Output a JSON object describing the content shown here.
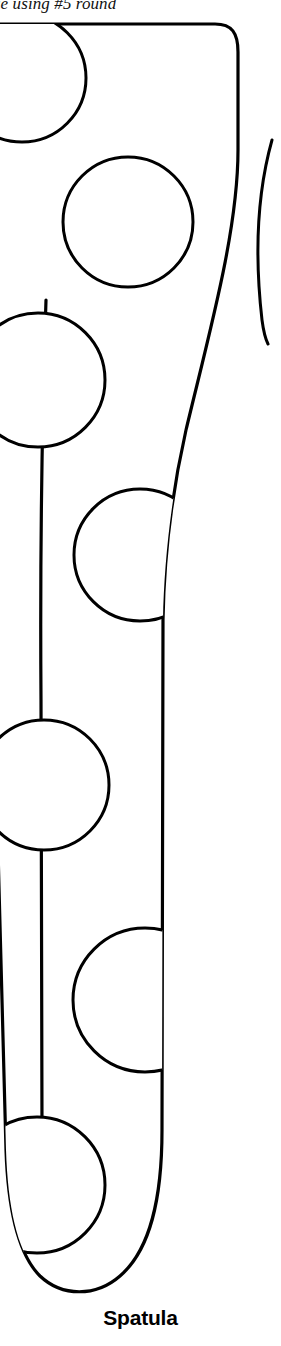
{
  "page": {
    "width": 281,
    "height": 1346,
    "background_color": "#ffffff",
    "ink_color": "#000000",
    "media_type": "line-art-illustration"
  },
  "top_caption": {
    "text": "ue using #5 round",
    "note": "clipped at image top and left edge",
    "style": "serif-italic"
  },
  "figure": {
    "label": "Spatula",
    "label_style": "bold-sans-serif",
    "outline_color": "#000000",
    "fill_color": "#ffffff",
    "stroke_width": 3
  },
  "holes": [
    {
      "name": "hole-1",
      "cx": 22,
      "cy": 78,
      "r": 64
    },
    {
      "name": "hole-2",
      "cx": 128,
      "cy": 222,
      "r": 65
    },
    {
      "name": "hole-3",
      "cx": 38,
      "cy": 380,
      "r": 67
    },
    {
      "name": "hole-4",
      "cx": 140,
      "cy": 555,
      "r": 66
    },
    {
      "name": "hole-5",
      "cx": 44,
      "cy": 785,
      "r": 65
    },
    {
      "name": "hole-6",
      "cx": 145,
      "cy": 1000,
      "r": 72
    },
    {
      "name": "hole-7",
      "cx": 37,
      "cy": 1185,
      "r": 68
    }
  ],
  "partial_shape": {
    "name": "adjacent-figure-edge",
    "note": "arc fragment of a neighbouring illustration cropped at right edge"
  }
}
